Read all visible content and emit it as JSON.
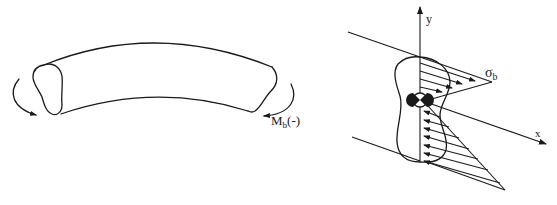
{
  "figure": {
    "left_panel": {
      "description": "Curved beam with lobed cross-section subjected to negative bending moment",
      "moment_label": {
        "symbol": "M",
        "subscript": "b",
        "suffix": "(-)"
      }
    },
    "right_panel": {
      "description": "Cross-section with linear bending stress distribution about neutral axis",
      "stress_label": {
        "symbol": "σ",
        "subscript": "b"
      },
      "axes": {
        "x_label": "x",
        "y_label": "y"
      },
      "centroid_marker": "neutral-axis-centroid-symbol"
    },
    "colors": {
      "ink": "#1a1a1a",
      "background": "#ffffff"
    }
  }
}
